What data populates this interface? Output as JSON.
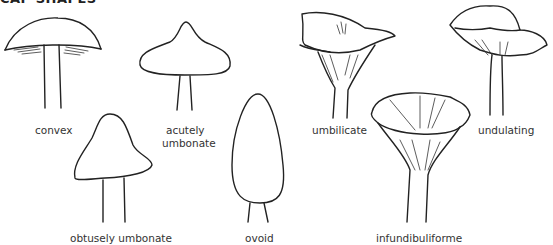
{
  "title": "CAP SHAPES",
  "shapes": [
    {
      "id": "convex",
      "label": "convex"
    },
    {
      "id": "acutely-umbonate",
      "label": "acutely",
      "label2": "umbonate"
    },
    {
      "id": "obtusely-umbonate",
      "label": "obtusely umbonate"
    },
    {
      "id": "ovoid",
      "label": "ovoid"
    },
    {
      "id": "umbilicate",
      "label": "umbilicate"
    },
    {
      "id": "infundibuliforme",
      "label": "infundibuliforme"
    },
    {
      "id": "undulating",
      "label": "undulating"
    }
  ],
  "colors": {
    "line": "#222222",
    "text": "#333333",
    "background": "#ffffff"
  }
}
